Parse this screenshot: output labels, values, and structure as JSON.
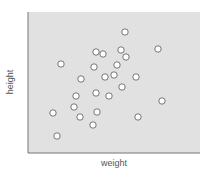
{
  "chart_data": {
    "type": "scatter",
    "title": "",
    "xlabel": "weight",
    "ylabel": "height",
    "grid": false,
    "legend": null,
    "xlim": [
      0,
      172
    ],
    "ylim": [
      0,
      141
    ],
    "plot_background": "#e1e1e1",
    "axis_color": "#777777",
    "marker": {
      "fill": "#ffffff",
      "stroke": "#666666",
      "radius": 3.2
    },
    "points": [
      {
        "x": 97,
        "y": 121
      },
      {
        "x": 68,
        "y": 101
      },
      {
        "x": 75,
        "y": 99
      },
      {
        "x": 93,
        "y": 103
      },
      {
        "x": 98,
        "y": 96
      },
      {
        "x": 130,
        "y": 104
      },
      {
        "x": 33,
        "y": 89
      },
      {
        "x": 66,
        "y": 86
      },
      {
        "x": 89,
        "y": 88
      },
      {
        "x": 53,
        "y": 74
      },
      {
        "x": 77,
        "y": 76
      },
      {
        "x": 86,
        "y": 78
      },
      {
        "x": 108,
        "y": 76
      },
      {
        "x": 94,
        "y": 66
      },
      {
        "x": 68,
        "y": 60
      },
      {
        "x": 48,
        "y": 57
      },
      {
        "x": 81,
        "y": 57
      },
      {
        "x": 134,
        "y": 52
      },
      {
        "x": 46,
        "y": 46
      },
      {
        "x": 25,
        "y": 40
      },
      {
        "x": 69,
        "y": 41
      },
      {
        "x": 52,
        "y": 36
      },
      {
        "x": 110,
        "y": 36
      },
      {
        "x": 65,
        "y": 28
      },
      {
        "x": 29,
        "y": 17
      }
    ]
  },
  "labels": {
    "x": "weight",
    "y": "height"
  }
}
